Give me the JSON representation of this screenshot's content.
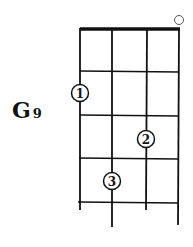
{
  "chord": {
    "root": "G",
    "extension": "9",
    "open_string_marker": "○",
    "fingers": [
      {
        "label": "1",
        "string": 1,
        "fret": 2
      },
      {
        "label": "2",
        "string": 3,
        "fret": 3
      },
      {
        "label": "3",
        "string": 2,
        "fret": 4
      }
    ],
    "open_strings": [
      4
    ]
  },
  "colors": {
    "line": "#111111",
    "background": "#ffffff"
  }
}
